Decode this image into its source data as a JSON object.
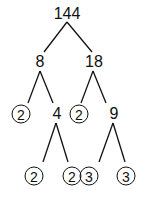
{
  "diagram": {
    "type": "factor-tree",
    "root": "144",
    "nodes": [
      {
        "id": "n144",
        "label": "144",
        "circled": false,
        "x": 67,
        "y": 14
      },
      {
        "id": "n8",
        "label": "8",
        "circled": false,
        "x": 40,
        "y": 62
      },
      {
        "id": "n18",
        "label": "18",
        "circled": false,
        "x": 94,
        "y": 62
      },
      {
        "id": "n2a",
        "label": "2",
        "circled": true,
        "x": 21,
        "y": 114
      },
      {
        "id": "n4",
        "label": "4",
        "circled": false,
        "x": 57,
        "y": 114
      },
      {
        "id": "n2b",
        "label": "2",
        "circled": true,
        "x": 79,
        "y": 114
      },
      {
        "id": "n9",
        "label": "9",
        "circled": false,
        "x": 114,
        "y": 114
      },
      {
        "id": "n2c",
        "label": "2",
        "circled": true,
        "x": 34,
        "y": 176
      },
      {
        "id": "n2d",
        "label": "2",
        "circled": true,
        "x": 72,
        "y": 176
      },
      {
        "id": "n3a",
        "label": "3",
        "circled": true,
        "x": 89,
        "y": 176
      },
      {
        "id": "n3b",
        "label": "3",
        "circled": true,
        "x": 126,
        "y": 176
      }
    ],
    "edges": [
      [
        "n144",
        "n8"
      ],
      [
        "n144",
        "n18"
      ],
      [
        "n8",
        "n2a"
      ],
      [
        "n8",
        "n4"
      ],
      [
        "n18",
        "n2b"
      ],
      [
        "n18",
        "n9"
      ],
      [
        "n4",
        "n2c"
      ],
      [
        "n4",
        "n2d"
      ],
      [
        "n9",
        "n3a"
      ],
      [
        "n9",
        "n3b"
      ]
    ]
  }
}
